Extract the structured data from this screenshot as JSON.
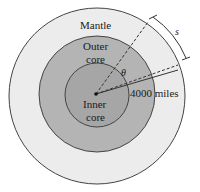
{
  "diagram": {
    "layers": [
      {
        "name": "mantle",
        "label": "Mantle",
        "color": "#ececec"
      },
      {
        "name": "outer-core",
        "label_line1": "Outer",
        "label_line2": "core",
        "color": "#b4b4b4"
      },
      {
        "name": "inner-core",
        "label_line1": "Inner",
        "label_line2": "core",
        "color": "#a6a6a6"
      }
    ],
    "angle_label": "θ",
    "radius_label": "4000 miles",
    "arc_label": "s",
    "stroke_color": "#333333"
  }
}
